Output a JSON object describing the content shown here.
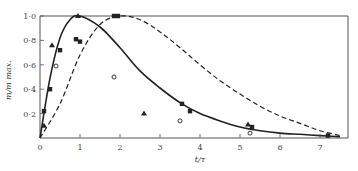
{
  "chart_data": {
    "type": "line",
    "title": "",
    "xlabel": "t/τ",
    "ylabel": "m/m max.",
    "xlim": [
      0,
      7.7
    ],
    "ylim": [
      0,
      1.0
    ],
    "grid": false,
    "legend": null,
    "x_ticks": [
      "0",
      "1",
      "2",
      "3",
      "4",
      "5",
      "6",
      "7"
    ],
    "y_ticks": [
      "0·2",
      "0·4",
      "0·6",
      "0·8",
      "1·0"
    ],
    "series": [
      {
        "name": "theoretical curve (solid)",
        "style": "solid",
        "peak_x": 1.0,
        "x": [
          0,
          0.25,
          0.5,
          0.75,
          1.0,
          1.5,
          2.0,
          2.5,
          3.0,
          3.5,
          4.0,
          4.5,
          5.0,
          5.5,
          6.0,
          6.5,
          7.0,
          7.5
        ],
        "values": [
          0,
          0.49,
          0.82,
          0.97,
          1.0,
          0.91,
          0.74,
          0.55,
          0.41,
          0.29,
          0.2,
          0.14,
          0.09,
          0.06,
          0.04,
          0.03,
          0.02,
          0.01
        ]
      },
      {
        "name": "theoretical curve (dashed)",
        "style": "dashed",
        "peak_x": 2.0,
        "x": [
          0,
          0.5,
          1.0,
          1.5,
          2.0,
          2.5,
          3.0,
          3.5,
          4.0,
          4.5,
          5.0,
          5.5,
          6.0,
          6.5,
          7.0,
          7.5
        ],
        "values": [
          0,
          0.28,
          0.68,
          0.93,
          1.0,
          0.97,
          0.87,
          0.74,
          0.6,
          0.47,
          0.36,
          0.26,
          0.18,
          0.12,
          0.06,
          0.02
        ]
      },
      {
        "name": "triangles",
        "marker": "triangle",
        "x": [
          0.1,
          0.3,
          0.95,
          2.6,
          5.2
        ],
        "values": [
          0.1,
          0.76,
          1.0,
          0.2,
          0.11
        ]
      },
      {
        "name": "filled squares",
        "marker": "square",
        "x": [
          0.1,
          0.25,
          0.5,
          0.9,
          1.0,
          1.85,
          1.95,
          3.55,
          3.75,
          5.3,
          7.2
        ],
        "values": [
          0.22,
          0.4,
          0.72,
          0.81,
          0.79,
          1.0,
          1.0,
          0.28,
          0.22,
          0.09,
          0.02
        ]
      },
      {
        "name": "open circles",
        "marker": "circle-open",
        "x": [
          0.4,
          1.85,
          3.5,
          5.25
        ],
        "values": [
          0.59,
          0.5,
          0.14,
          0.04
        ]
      }
    ]
  }
}
